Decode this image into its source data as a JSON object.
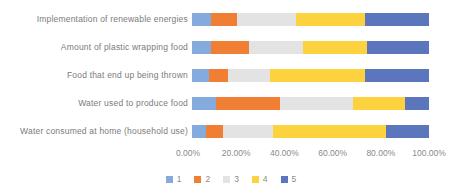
{
  "chart_data": {
    "type": "bar",
    "orientation": "horizontal-stacked",
    "title": "",
    "xlabel": "",
    "ylabel": "",
    "xlim": [
      0,
      100
    ],
    "grid": false,
    "categories": [
      "Implementation of renewable energies",
      "Amount of plastic wrapping food",
      "Food that end up being thrown",
      "Water used to produce food",
      "Water consumed at home (household use)"
    ],
    "series": [
      {
        "name": "1",
        "color": "#85AADE",
        "values": [
          8,
          8,
          7,
          10,
          6
        ]
      },
      {
        "name": "2",
        "color": "#F07E33",
        "values": [
          11,
          16,
          8,
          27,
          7
        ]
      },
      {
        "name": "3",
        "color": "#E3E3E3",
        "values": [
          25,
          23,
          18,
          31,
          21
        ]
      },
      {
        "name": "4",
        "color": "#FCD33E",
        "values": [
          29,
          27,
          40,
          22,
          48
        ]
      },
      {
        "name": "5",
        "color": "#5B76BD",
        "values": [
          27,
          26,
          27,
          10,
          18
        ]
      }
    ],
    "x_ticks": [
      "0.00%",
      "20.00%",
      "40.00%",
      "60.00%",
      "80.00%",
      "100.00%"
    ],
    "legend": {
      "position": "bottom",
      "entries": [
        "1",
        "2",
        "3",
        "4",
        "5"
      ]
    }
  },
  "colors": {
    "background": "#FFFFFF",
    "category_label_text": "#7B7B7B",
    "axis_tick_text": "#8A8A8A",
    "legend_text": "#8A8A8A"
  }
}
